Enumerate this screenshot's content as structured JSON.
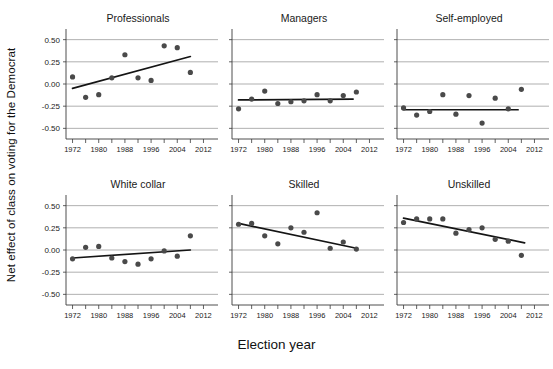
{
  "chart_data": {
    "type": "scatter",
    "title": "",
    "xlabel": "Election year",
    "ylabel": "Net effect of class on voting for the Democrat",
    "xlim": [
      1970,
      2014
    ],
    "ylim": [
      -0.62,
      0.62
    ],
    "yticks": [
      0.5,
      0.25,
      0.0,
      -0.25,
      -0.5
    ],
    "ytick_labels": [
      "0.50",
      "0.25",
      "0.00",
      "-0.25",
      "-0.50"
    ],
    "xticks": [
      1972,
      1976,
      1980,
      1984,
      1988,
      1992,
      1996,
      2000,
      2004,
      2008,
      2012
    ],
    "xtick_labels": [
      "1972",
      "",
      "1980",
      "",
      "1988",
      "",
      "1996",
      "",
      "2004",
      "",
      "2012"
    ],
    "xtick_labels_shown": [
      "1972",
      "1980",
      "1988",
      "1996",
      "2004",
      "2012"
    ],
    "grid": true,
    "legend": "none",
    "layout": {
      "rows": 2,
      "cols": 3
    },
    "panels": [
      {
        "name": "Professionals",
        "x": [
          1972,
          1976,
          1980,
          1984,
          1988,
          1992,
          1996,
          2000,
          2004,
          2008
        ],
        "y": [
          0.08,
          -0.15,
          -0.12,
          0.07,
          0.33,
          0.07,
          0.04,
          0.43,
          0.41,
          0.13
        ],
        "fit": {
          "x0": 1972,
          "y0": -0.05,
          "x1": 2008,
          "y1": 0.31
        }
      },
      {
        "name": "Managers",
        "x": [
          1972,
          1976,
          1980,
          1984,
          1988,
          1992,
          1996,
          2000,
          2004,
          2008
        ],
        "y": [
          -0.28,
          -0.17,
          -0.08,
          -0.22,
          -0.2,
          -0.19,
          -0.12,
          -0.19,
          -0.13,
          -0.09
        ],
        "fit": {
          "x0": 1972,
          "y0": -0.18,
          "x1": 2007,
          "y1": -0.17
        }
      },
      {
        "name": "Self-employed",
        "x": [
          1972,
          1976,
          1980,
          1984,
          1988,
          1992,
          1996,
          2000,
          2004,
          2008
        ],
        "y": [
          -0.27,
          -0.35,
          -0.31,
          -0.12,
          -0.34,
          -0.13,
          -0.44,
          -0.16,
          -0.28,
          -0.06
        ],
        "fit": {
          "x0": 1972,
          "y0": -0.29,
          "x1": 2007,
          "y1": -0.29
        }
      },
      {
        "name": "White collar",
        "x": [
          1972,
          1976,
          1980,
          1984,
          1988,
          1992,
          1996,
          2000,
          2004,
          2008
        ],
        "y": [
          -0.1,
          0.03,
          0.04,
          -0.09,
          -0.13,
          -0.16,
          -0.1,
          -0.01,
          -0.07,
          0.16
        ],
        "fit": {
          "x0": 1972,
          "y0": -0.09,
          "x1": 2008,
          "y1": 0.0
        }
      },
      {
        "name": "Skilled",
        "x": [
          1972,
          1976,
          1980,
          1984,
          1988,
          1992,
          1996,
          2000,
          2004,
          2008
        ],
        "y": [
          0.29,
          0.3,
          0.16,
          0.07,
          0.25,
          0.2,
          0.42,
          0.02,
          0.09,
          0.01
        ],
        "fit": {
          "x0": 1972,
          "y0": 0.3,
          "x1": 2008,
          "y1": 0.02
        }
      },
      {
        "name": "Unskilled",
        "x": [
          1972,
          1976,
          1980,
          1984,
          1988,
          1992,
          1996,
          2000,
          2004,
          2008
        ],
        "y": [
          0.31,
          0.35,
          0.35,
          0.35,
          0.19,
          0.23,
          0.25,
          0.12,
          0.1,
          -0.06
        ],
        "fit": {
          "x0": 1972,
          "y0": 0.36,
          "x1": 2009,
          "y1": 0.08
        }
      }
    ]
  }
}
